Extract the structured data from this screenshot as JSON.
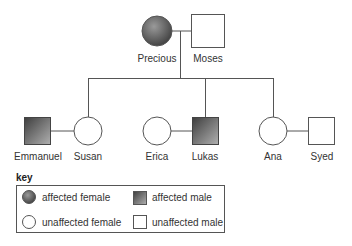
{
  "diagram": {
    "type": "pedigree",
    "colors": {
      "line": "#555555",
      "affected_dark": "#4a4a4a",
      "affected_light": "#a0a0a0",
      "unaffected": "#ffffff"
    },
    "generations": [
      {
        "members": [
          {
            "name": "Precious",
            "sex": "female",
            "affected": true
          },
          {
            "name": "Moses",
            "sex": "male",
            "affected": false
          }
        ]
      },
      {
        "members": [
          {
            "name": "Emmanuel",
            "sex": "male",
            "affected": true,
            "partner_of": "Susan"
          },
          {
            "name": "Susan",
            "sex": "female",
            "affected": false,
            "child_of": "Precious & Moses"
          },
          {
            "name": "Erica",
            "sex": "female",
            "affected": false,
            "partner_of": "Lukas"
          },
          {
            "name": "Lukas",
            "sex": "male",
            "affected": true,
            "child_of": "Precious & Moses"
          },
          {
            "name": "Ana",
            "sex": "female",
            "affected": false,
            "child_of": "Precious & Moses"
          },
          {
            "name": "Syed",
            "sex": "male",
            "affected": false,
            "partner_of": "Ana"
          }
        ]
      }
    ],
    "labels": {
      "precious": "Precious",
      "moses": "Moses",
      "emmanuel": "Emmanuel",
      "susan": "Susan",
      "erica": "Erica",
      "lukas": "Lukas",
      "ana": "Ana",
      "syed": "Syed"
    },
    "key": {
      "title": "key",
      "items": [
        {
          "label": "affected female",
          "symbol": "filled-circle"
        },
        {
          "label": "affected male",
          "symbol": "filled-square"
        },
        {
          "label": "unaffected female",
          "symbol": "empty-circle"
        },
        {
          "label": "unaffected male",
          "symbol": "empty-square"
        }
      ]
    }
  }
}
